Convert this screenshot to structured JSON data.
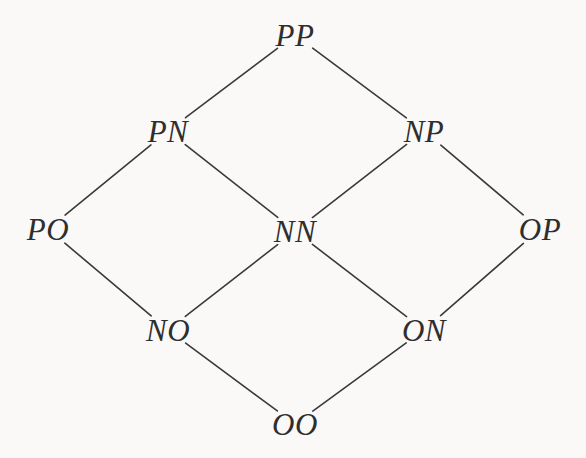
{
  "diagram": {
    "type": "hasse-lattice",
    "background_color": "#faf9f7",
    "edge_color": "#3a3a3a",
    "label_color": "#2e2e2e",
    "edge_width": 1.6,
    "label_gap": 22,
    "width": 586,
    "height": 458,
    "nodes": [
      {
        "id": "PP",
        "label": "PP",
        "x": 295,
        "y": 35,
        "rank": 0
      },
      {
        "id": "PN",
        "label": "PN",
        "x": 168,
        "y": 131,
        "rank": 1
      },
      {
        "id": "NP",
        "label": "NP",
        "x": 424,
        "y": 131,
        "rank": 1
      },
      {
        "id": "PO",
        "label": "PO",
        "x": 48,
        "y": 229,
        "rank": 2
      },
      {
        "id": "NN",
        "label": "NN",
        "x": 295,
        "y": 231,
        "rank": 2
      },
      {
        "id": "OP",
        "label": "OP",
        "x": 540,
        "y": 229,
        "rank": 2
      },
      {
        "id": "NO",
        "label": "NO",
        "x": 168,
        "y": 330,
        "rank": 3
      },
      {
        "id": "ON",
        "label": "ON",
        "x": 424,
        "y": 330,
        "rank": 3
      },
      {
        "id": "OO",
        "label": "OO",
        "x": 295,
        "y": 424,
        "rank": 4
      }
    ],
    "edges": [
      {
        "from": "PN",
        "to": "PP"
      },
      {
        "from": "NP",
        "to": "PP"
      },
      {
        "from": "PO",
        "to": "PN"
      },
      {
        "from": "NN",
        "to": "PN"
      },
      {
        "from": "NN",
        "to": "NP"
      },
      {
        "from": "OP",
        "to": "NP"
      },
      {
        "from": "NO",
        "to": "PO"
      },
      {
        "from": "NO",
        "to": "NN"
      },
      {
        "from": "ON",
        "to": "NN"
      },
      {
        "from": "ON",
        "to": "OP"
      },
      {
        "from": "OO",
        "to": "NO"
      },
      {
        "from": "OO",
        "to": "ON"
      }
    ]
  }
}
